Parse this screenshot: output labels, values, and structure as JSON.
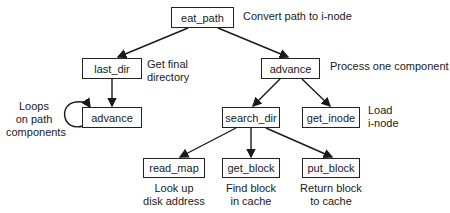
{
  "nodes": {
    "eat_path": {
      "label": "eat_path",
      "note": "Convert path to i-node"
    },
    "last_dir": {
      "label": "last_dir",
      "note": "Get final\ndirectory"
    },
    "advance_left": {
      "label": "advance",
      "note": "Loops\non path\ncomponents"
    },
    "advance_right": {
      "label": "advance",
      "note": "Process one component"
    },
    "search_dir": {
      "label": "search_dir"
    },
    "get_inode": {
      "label": "get_inode",
      "note": "Load\ni-node"
    },
    "read_map": {
      "label": "read_map",
      "note": "Look up\ndisk address"
    },
    "get_block": {
      "label": "get_block",
      "note": "Find block\nin cache"
    },
    "put_block": {
      "label": "put_block",
      "note": "Return block\nto cache"
    }
  },
  "edges": [
    {
      "from": "eat_path",
      "to": "last_dir"
    },
    {
      "from": "eat_path",
      "to": "advance_right"
    },
    {
      "from": "last_dir",
      "to": "advance_left"
    },
    {
      "from": "advance_left",
      "to": "advance_left",
      "type": "loop"
    },
    {
      "from": "advance_right",
      "to": "search_dir"
    },
    {
      "from": "advance_right",
      "to": "get_inode"
    },
    {
      "from": "search_dir",
      "to": "read_map"
    },
    {
      "from": "search_dir",
      "to": "get_block"
    },
    {
      "from": "search_dir",
      "to": "put_block"
    }
  ]
}
